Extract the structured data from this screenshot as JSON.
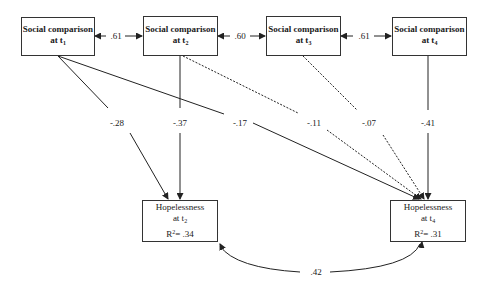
{
  "diagram": {
    "type": "path_model",
    "predictors": [
      {
        "id": "sc1",
        "label": "Social comparison",
        "time": "at t",
        "time_sub": "1"
      },
      {
        "id": "sc2",
        "label": "Social comparison",
        "time": "at t",
        "time_sub": "2"
      },
      {
        "id": "sc3",
        "label": "Social comparison",
        "time": "at t",
        "time_sub": "3"
      },
      {
        "id": "sc4",
        "label": "Social comparison",
        "time": "at t",
        "time_sub": "4"
      }
    ],
    "outcomes": [
      {
        "id": "h2",
        "label": "Hopelessness",
        "time": "at t",
        "time_sub": "2",
        "r2_prefix": "R",
        "r2_sup": "2",
        "r2_value": "= .34"
      },
      {
        "id": "h4",
        "label": "Hopelessness",
        "time": "at t",
        "time_sub": "4",
        "r2_prefix": "R",
        "r2_sup": "2",
        "r2_value": "= .31"
      }
    ],
    "correlations": [
      {
        "from": "sc1",
        "to": "sc2",
        "value": ".61"
      },
      {
        "from": "sc2",
        "to": "sc3",
        "value": ".60"
      },
      {
        "from": "sc3",
        "to": "sc4",
        "value": ".61"
      },
      {
        "from": "h2",
        "to": "h4",
        "value": ".42"
      }
    ],
    "paths": [
      {
        "from": "sc1",
        "to": "h2",
        "value": "-.28",
        "style": "solid"
      },
      {
        "from": "sc2",
        "to": "h2",
        "value": "-.37",
        "style": "solid"
      },
      {
        "from": "sc1",
        "to": "h4",
        "value": "-.17",
        "style": "solid"
      },
      {
        "from": "sc2",
        "to": "h4",
        "value": "-.11",
        "style": "dashed"
      },
      {
        "from": "sc3",
        "to": "h4",
        "value": "-.07",
        "style": "dashed"
      },
      {
        "from": "sc4",
        "to": "h4",
        "value": "-.41",
        "style": "solid"
      }
    ]
  }
}
